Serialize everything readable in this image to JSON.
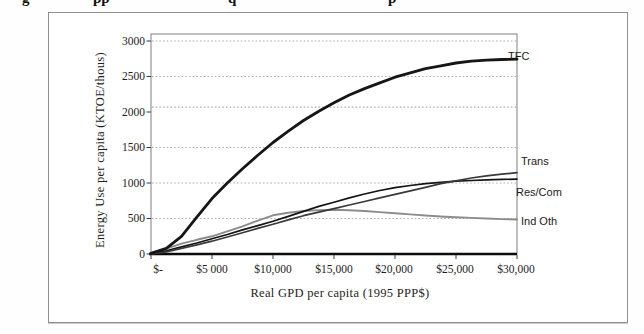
{
  "figure": {
    "caption_fragments": [
      "g",
      "pp",
      "q",
      "p"
    ]
  },
  "chart_data": {
    "type": "line",
    "title": "",
    "xlabel": "Real GPD per capita (1995 PPP$)",
    "ylabel": "Energy Use per capita (KTOE/thous)",
    "xlim": [
      0,
      30000
    ],
    "ylim": [
      0,
      3000
    ],
    "grid": "horizontal dotted",
    "gridline_values": [
      500,
      1000,
      1500,
      2070,
      2500,
      3000
    ],
    "legend_position": "labels at right edge of curves",
    "x_tick_values": [
      0,
      5000,
      10000,
      15000,
      20000,
      25000,
      30000
    ],
    "x_tick_labels": [
      "$-",
      "$5 000",
      "$10,000",
      "$15,000",
      "$20,000",
      "$25,000",
      "$30,000"
    ],
    "y_tick_values": [
      0,
      500,
      1000,
      1500,
      2000,
      2500,
      3000
    ],
    "y_tick_labels": [
      "0",
      "500",
      "1000",
      "1500",
      "2000",
      "2500",
      "3000"
    ],
    "x": [
      0,
      1250,
      2500,
      3750,
      5000,
      6250,
      7500,
      8750,
      10000,
      11250,
      12500,
      13750,
      15000,
      16250,
      17500,
      18750,
      20000,
      21250,
      22500,
      23750,
      25000,
      26250,
      27500,
      28750,
      30000
    ],
    "series": [
      {
        "name": "TFC",
        "color": "#161616",
        "width": 2.8,
        "values": [
          10,
          80,
          250,
          520,
          780,
          1000,
          1200,
          1390,
          1570,
          1730,
          1880,
          2010,
          2130,
          2240,
          2330,
          2410,
          2490,
          2550,
          2610,
          2650,
          2690,
          2715,
          2730,
          2740,
          2745
        ]
      },
      {
        "name": "Trans",
        "color": "#3a3a3a",
        "width": 1.7,
        "values": [
          0,
          30,
          80,
          130,
          180,
          240,
          300,
          360,
          420,
          480,
          540,
          590,
          640,
          690,
          740,
          790,
          840,
          890,
          940,
          990,
          1030,
          1070,
          1100,
          1125,
          1145
        ]
      },
      {
        "name": "Res/Com",
        "color": "#141414",
        "width": 1.7,
        "values": [
          5,
          45,
          100,
          155,
          215,
          275,
          340,
          400,
          460,
          530,
          600,
          670,
          730,
          790,
          845,
          895,
          935,
          965,
          990,
          1010,
          1025,
          1035,
          1045,
          1050,
          1055
        ]
      },
      {
        "name": "Ind Oth",
        "color": "#8c8c8c",
        "width": 1.9,
        "values": [
          15,
          75,
          145,
          200,
          250,
          320,
          390,
          470,
          545,
          580,
          605,
          618,
          622,
          616,
          605,
          590,
          575,
          558,
          542,
          528,
          517,
          508,
          500,
          492,
          486
        ]
      }
    ]
  }
}
